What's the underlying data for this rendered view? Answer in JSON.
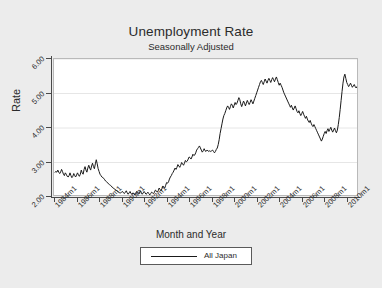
{
  "chart_data": {
    "type": "line",
    "title": "Unemployment Rate",
    "subtitle": "Seasonally Adjusted",
    "xlabel": "Month and Year",
    "ylabel": "Rate",
    "ylim": [
      2.0,
      6.0
    ],
    "yticks": [
      2.0,
      3.0,
      4.0,
      5.0,
      6.0
    ],
    "ytick_labels": [
      "2.00",
      "3.00",
      "4.00",
      "5.00",
      "6.00"
    ],
    "xlim": [
      "1984m1",
      "2010m12"
    ],
    "xtick_labels": [
      "1984m1",
      "1986m1",
      "1988m1",
      "1990m1",
      "1992m1",
      "1994m1",
      "1996m1",
      "1998m1",
      "2000m1",
      "2002m1",
      "2004m1",
      "2006m1",
      "2008m1",
      "2010m1"
    ],
    "grid": "horizontal",
    "legend_position": "below-axis-title",
    "series": [
      {
        "name": "All Japan",
        "color": "#1a1a1a",
        "x_start": "1984m1",
        "x_step_months": 1,
        "values": [
          2.72,
          2.74,
          2.72,
          2.78,
          2.72,
          2.68,
          2.72,
          2.8,
          2.74,
          2.66,
          2.62,
          2.7,
          2.66,
          2.6,
          2.58,
          2.62,
          2.7,
          2.62,
          2.56,
          2.6,
          2.68,
          2.62,
          2.58,
          2.64,
          2.7,
          2.64,
          2.6,
          2.66,
          2.78,
          2.7,
          2.66,
          2.8,
          2.88,
          2.78,
          2.72,
          2.84,
          2.92,
          2.84,
          2.78,
          2.9,
          2.98,
          2.88,
          2.82,
          2.96,
          3.08,
          2.96,
          2.82,
          2.74,
          2.66,
          2.62,
          2.58,
          2.56,
          2.54,
          2.5,
          2.46,
          2.44,
          2.42,
          2.38,
          2.36,
          2.34,
          2.32,
          2.28,
          2.26,
          2.24,
          2.22,
          2.2,
          2.18,
          2.16,
          2.14,
          2.12,
          2.12,
          2.14,
          2.16,
          2.12,
          2.1,
          2.14,
          2.18,
          2.12,
          2.08,
          2.12,
          2.16,
          2.1,
          2.08,
          2.12,
          2.1,
          2.06,
          2.1,
          2.16,
          2.12,
          2.08,
          2.12,
          2.18,
          2.12,
          2.08,
          2.12,
          2.16,
          2.12,
          2.08,
          2.1,
          2.14,
          2.1,
          2.06,
          2.1,
          2.14,
          2.12,
          2.1,
          2.14,
          2.2,
          2.18,
          2.14,
          2.18,
          2.26,
          2.22,
          2.18,
          2.24,
          2.32,
          2.28,
          2.26,
          2.34,
          2.42,
          2.4,
          2.44,
          2.52,
          2.58,
          2.62,
          2.68,
          2.72,
          2.78,
          2.84,
          2.8,
          2.86,
          2.94,
          2.9,
          2.86,
          2.92,
          3.0,
          2.96,
          2.92,
          2.98,
          3.06,
          3.02,
          3.04,
          3.1,
          3.16,
          3.14,
          3.1,
          3.16,
          3.24,
          3.2,
          3.22,
          3.28,
          3.36,
          3.4,
          3.44,
          3.48,
          3.42,
          3.36,
          3.3,
          3.34,
          3.4,
          3.34,
          3.32,
          3.36,
          3.34,
          3.32,
          3.34,
          3.32,
          3.34,
          3.36,
          3.32,
          3.28,
          3.32,
          3.38,
          3.42,
          3.52,
          3.66,
          3.84,
          3.98,
          4.12,
          4.26,
          4.36,
          4.42,
          4.5,
          4.58,
          4.64,
          4.6,
          4.54,
          4.62,
          4.7,
          4.66,
          4.58,
          4.66,
          4.74,
          4.68,
          4.72,
          4.8,
          4.88,
          4.82,
          4.7,
          4.62,
          4.7,
          4.78,
          4.72,
          4.64,
          4.72,
          4.8,
          4.74,
          4.68,
          4.74,
          4.82,
          4.76,
          4.7,
          4.78,
          4.86,
          4.94,
          5.02,
          5.1,
          5.18,
          5.26,
          5.34,
          5.38,
          5.32,
          5.26,
          5.34,
          5.42,
          5.36,
          5.3,
          5.38,
          5.44,
          5.38,
          5.32,
          5.4,
          5.46,
          5.4,
          5.34,
          5.42,
          5.48,
          5.4,
          5.32,
          5.24,
          5.3,
          5.24,
          5.18,
          5.1,
          5.02,
          4.96,
          4.9,
          4.84,
          4.78,
          4.72,
          4.66,
          4.6,
          4.66,
          4.58,
          4.52,
          4.58,
          4.64,
          4.56,
          4.48,
          4.44,
          4.5,
          4.42,
          4.36,
          4.42,
          4.48,
          4.4,
          4.34,
          4.28,
          4.34,
          4.26,
          4.2,
          4.16,
          4.22,
          4.14,
          4.08,
          4.04,
          4.1,
          4.04,
          3.98,
          3.92,
          3.86,
          3.8,
          3.74,
          3.68,
          3.62,
          3.68,
          3.76,
          3.84,
          3.9,
          3.84,
          3.92,
          3.98,
          3.9,
          3.96,
          4.02,
          3.94,
          3.88,
          3.94,
          4.0,
          3.92,
          3.86,
          3.94,
          4.1,
          4.3,
          4.54,
          4.8,
          5.06,
          5.3,
          5.48,
          5.56,
          5.44,
          5.32,
          5.26,
          5.2,
          5.24,
          5.3,
          5.24,
          5.18,
          5.22,
          5.26,
          5.2,
          5.16,
          5.2,
          5.24
        ]
      }
    ]
  },
  "legend": {
    "entries": [
      {
        "label": "All Japan"
      }
    ]
  }
}
